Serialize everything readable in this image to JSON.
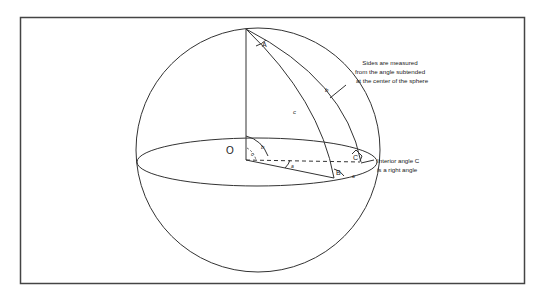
{
  "diagram": {
    "labels": {
      "center": "O",
      "angle_A": "A",
      "angle_B": "B",
      "angle_C": "C",
      "side_a": "a",
      "side_b": "b",
      "side_c": "c",
      "center_angle_a": "a",
      "center_angle_b": "b",
      "center_angle_c": "c"
    },
    "annotations": {
      "sides_line1": "Sides are measured",
      "sides_line2": "from the angle subtended",
      "sides_line3": "at the center of the sphere",
      "right_angle_line1": "Interior angle C",
      "right_angle_line2": "is a right angle"
    },
    "colors": {
      "stroke": "#333333",
      "frame": "#444444",
      "background": "#ffffff"
    }
  }
}
